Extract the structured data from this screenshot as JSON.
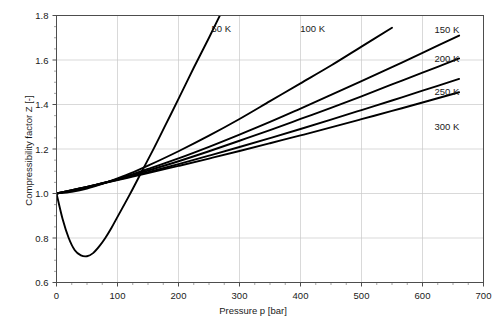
{
  "chart_data": {
    "type": "line",
    "title": "",
    "xlabel": "Pressure p [bar]",
    "ylabel": "Compressibility factor Z [-]",
    "xlim": [
      0,
      700
    ],
    "ylim": [
      0.6,
      1.8
    ],
    "xticks": [
      0,
      100,
      200,
      300,
      400,
      500,
      600,
      700
    ],
    "yticks": [
      0.6,
      0.8,
      1.0,
      1.2,
      1.4,
      1.6,
      1.8
    ],
    "xtick_labels": [
      "0",
      "100",
      "200",
      "300",
      "400",
      "500",
      "600",
      "700"
    ],
    "ytick_labels": [
      "0.6",
      "0.8",
      "1.0",
      "1.2",
      "1.4",
      "1.6",
      "1.8"
    ],
    "xminor_step": 25,
    "yminor_step": 0.05,
    "grid": true,
    "legend_position": "inline-labels",
    "line_color": "#000000",
    "grid_color": "#c8c8c8",
    "axis_color": "#4d4d4d",
    "series": [
      {
        "name": "50 K",
        "label": "50 K",
        "label_x": 270,
        "label_y": 1.74,
        "x": [
          0,
          10,
          20,
          30,
          40,
          50,
          60,
          70,
          80,
          90,
          100,
          120,
          140,
          160,
          180,
          200,
          225,
          250,
          275,
          300
        ],
        "values": [
          1.0,
          0.885,
          0.8,
          0.745,
          0.722,
          0.718,
          0.732,
          0.762,
          0.8,
          0.845,
          0.895,
          0.995,
          1.1,
          1.205,
          1.315,
          1.425,
          1.565,
          1.7,
          1.84,
          1.975
        ]
      },
      {
        "name": "100 K",
        "label": "100 K",
        "label_x": 420,
        "label_y": 1.74,
        "x": [
          0,
          25,
          50,
          75,
          100,
          125,
          150,
          200,
          250,
          300,
          350,
          400,
          450,
          500,
          550
        ],
        "values": [
          1.0,
          1.008,
          1.022,
          1.043,
          1.068,
          1.095,
          1.125,
          1.19,
          1.26,
          1.335,
          1.415,
          1.495,
          1.575,
          1.66,
          1.745
        ]
      },
      {
        "name": "150 K",
        "label": "150 K",
        "label_x": 640,
        "label_y": 1.735,
        "x": [
          0,
          25,
          50,
          75,
          100,
          125,
          150,
          200,
          250,
          300,
          350,
          400,
          450,
          500,
          550,
          600,
          660
        ],
        "values": [
          1.0,
          1.012,
          1.027,
          1.045,
          1.065,
          1.087,
          1.11,
          1.158,
          1.21,
          1.265,
          1.322,
          1.382,
          1.443,
          1.505,
          1.568,
          1.632,
          1.71
        ]
      },
      {
        "name": "200 K",
        "label": "200 K",
        "label_x": 640,
        "label_y": 1.605,
        "x": [
          0,
          25,
          50,
          75,
          100,
          125,
          150,
          200,
          250,
          300,
          350,
          400,
          450,
          500,
          550,
          600,
          660
        ],
        "values": [
          1.0,
          1.014,
          1.029,
          1.046,
          1.064,
          1.083,
          1.103,
          1.145,
          1.19,
          1.237,
          1.285,
          1.335,
          1.385,
          1.437,
          1.49,
          1.543,
          1.607
        ]
      },
      {
        "name": "250 K",
        "label": "250 K",
        "label_x": 640,
        "label_y": 1.46,
        "x": [
          0,
          25,
          50,
          75,
          100,
          125,
          150,
          200,
          250,
          300,
          350,
          400,
          450,
          500,
          550,
          600,
          660
        ],
        "values": [
          1.0,
          1.015,
          1.03,
          1.046,
          1.062,
          1.079,
          1.096,
          1.132,
          1.17,
          1.209,
          1.249,
          1.29,
          1.332,
          1.375,
          1.418,
          1.462,
          1.515
        ]
      },
      {
        "name": "300 K",
        "label": "300 K",
        "label_x": 640,
        "label_y": 1.3,
        "x": [
          0,
          25,
          50,
          75,
          100,
          125,
          150,
          200,
          250,
          300,
          350,
          400,
          450,
          500,
          550,
          600,
          660
        ],
        "values": [
          1.0,
          1.015,
          1.03,
          1.045,
          1.06,
          1.076,
          1.092,
          1.124,
          1.157,
          1.191,
          1.226,
          1.261,
          1.297,
          1.334,
          1.371,
          1.409,
          1.455
        ]
      }
    ]
  }
}
